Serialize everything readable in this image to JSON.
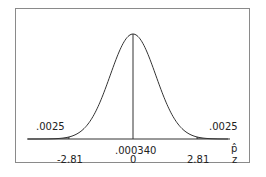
{
  "chart_data": {
    "type": "area",
    "title": "",
    "xlabel": "z",
    "xlabel_secondary": "p̂",
    "tick_labels_z": [
      "-2.81",
      "0",
      "2.81"
    ],
    "tick_labels_phat": [
      "",
      ".000340",
      ""
    ],
    "x": [
      -2.81,
      0,
      2.81
    ],
    "shaded_regions": [
      {
        "from": "-inf",
        "to": -2.81,
        "area": ".0025"
      },
      {
        "from": 2.81,
        "to": "inf",
        "area": ".0025"
      }
    ],
    "annotations": [
      ".0025",
      ".0025"
    ],
    "vertical_line_at": 0,
    "colors": {
      "curve": "#333333",
      "shade": "#a6a6a6",
      "frame": "#8a8a8a"
    }
  },
  "labels": {
    "left_tail": ".0025",
    "right_tail": ".0025",
    "center_phat": ".000340",
    "center_z": "0",
    "left_z": "-2.81",
    "right_z": "2.81",
    "axis_phat": "p̂",
    "axis_z": "z"
  }
}
